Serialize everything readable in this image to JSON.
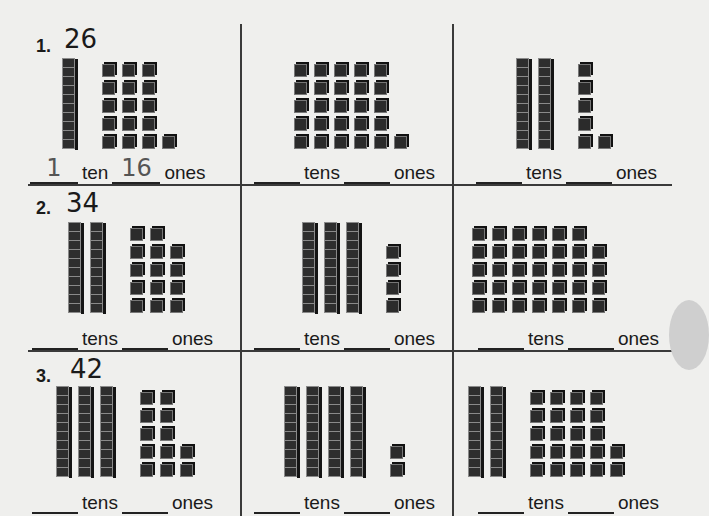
{
  "worksheet": {
    "problems": [
      {
        "number": "1.",
        "target": "26",
        "cells": [
          {
            "tens": 1,
            "ones": 16,
            "tens_label": "ten",
            "ones_label": "ones",
            "tens_answer": "1",
            "ones_answer": "16"
          },
          {
            "tens": 0,
            "ones": 26,
            "tens_label": "tens",
            "ones_label": "ones",
            "tens_answer": "",
            "ones_answer": ""
          },
          {
            "tens": 2,
            "ones": 6,
            "tens_label": "tens",
            "ones_label": "ones",
            "tens_answer": "",
            "ones_answer": ""
          }
        ]
      },
      {
        "number": "2.",
        "target": "34",
        "cells": [
          {
            "tens": 2,
            "ones": 14,
            "tens_label": "tens",
            "ones_label": "ones",
            "tens_answer": "",
            "ones_answer": ""
          },
          {
            "tens": 3,
            "ones": 4,
            "tens_label": "tens",
            "ones_label": "ones",
            "tens_answer": "",
            "ones_answer": ""
          },
          {
            "tens": 0,
            "ones": 34,
            "tens_label": "tens",
            "ones_label": "ones",
            "tens_answer": "",
            "ones_answer": ""
          }
        ]
      },
      {
        "number": "3.",
        "target": "42",
        "cells": [
          {
            "tens": 3,
            "ones": 12,
            "tens_label": "tens",
            "ones_label": "ones",
            "tens_answer": "",
            "ones_answer": ""
          },
          {
            "tens": 4,
            "ones": 2,
            "tens_label": "tens",
            "ones_label": "ones",
            "tens_answer": "",
            "ones_answer": ""
          },
          {
            "tens": 2,
            "ones": 22,
            "tens_label": "tens",
            "ones_label": "ones",
            "tens_answer": "",
            "ones_answer": ""
          }
        ]
      }
    ]
  }
}
